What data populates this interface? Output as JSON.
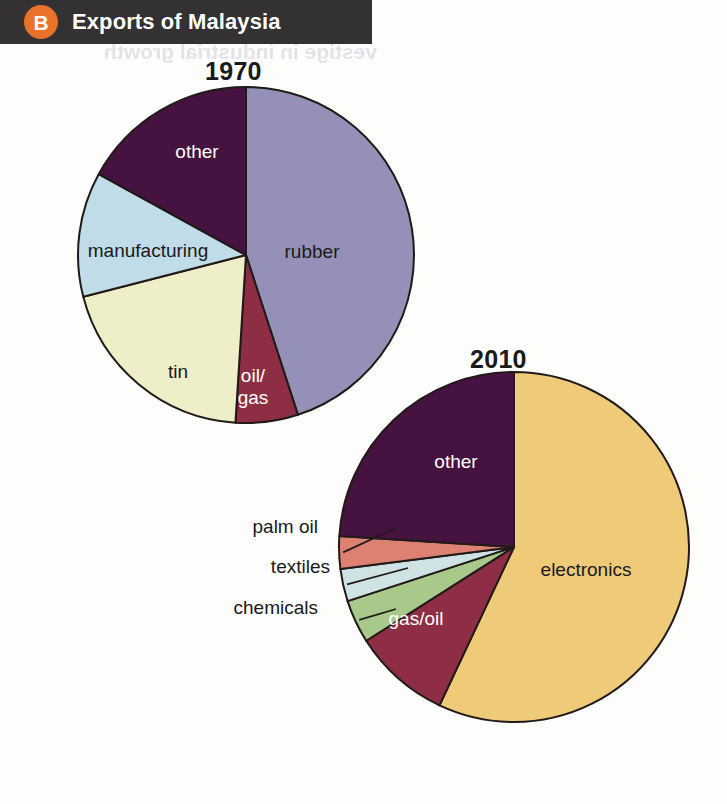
{
  "header": {
    "badge": "B",
    "title": "Exports of Malaysia",
    "badge_color": "#e8722a",
    "banner_color": "#333132",
    "text_color": "#ffffff"
  },
  "artifact": {
    "bleed_text": "vestige in industrial growth"
  },
  "chart_data": [
    {
      "type": "pie",
      "title": "1970",
      "id": "exports-1970",
      "center": {
        "x": 246,
        "y": 255
      },
      "radius": 168,
      "start_angle": 0,
      "direction": "clockwise",
      "legend": "none",
      "labels_inside": true,
      "slices": [
        {
          "label": "rubber",
          "value": 45,
          "color": "#9590b8",
          "text_color": "dark",
          "label_pos": {
            "x": 312,
            "y": 258
          }
        },
        {
          "label": "oil/\ngas",
          "value": 6,
          "color": "#8d2e44",
          "text_color": "light",
          "label_pos": {
            "x": 253,
            "y": 382
          }
        },
        {
          "label": "tin",
          "value": 20,
          "color": "#eeeec8",
          "text_color": "dark",
          "label_pos": {
            "x": 178,
            "y": 378
          }
        },
        {
          "label": "manufacturing",
          "value": 12,
          "color": "#bfdce8",
          "text_color": "dark",
          "label_pos": {
            "x": 148,
            "y": 257
          }
        },
        {
          "label": "other",
          "value": 17,
          "color": "#46123f",
          "text_color": "light",
          "label_pos": {
            "x": 197,
            "y": 158
          }
        }
      ]
    },
    {
      "type": "pie",
      "title": "2010",
      "id": "exports-2010",
      "center": {
        "x": 514,
        "y": 547
      },
      "radius": 175,
      "start_angle": 0,
      "direction": "clockwise",
      "legend": "none",
      "labels_inside": false,
      "slices": [
        {
          "label": "electronics",
          "value": 57,
          "color": "#efca79",
          "text_color": "dark",
          "label_pos": {
            "x": 586,
            "y": 576
          },
          "callout": false
        },
        {
          "label": "gas/oil",
          "value": 9,
          "color": "#8d2e44",
          "text_color": "light",
          "label_pos": {
            "x": 416,
            "y": 625
          },
          "callout": false
        },
        {
          "label": "chemicals",
          "value": 4,
          "color": "#a8c98a",
          "text_color": "dark",
          "label_pos": {
            "x": 318,
            "y": 614
          },
          "callout": true
        },
        {
          "label": "textiles",
          "value": 3,
          "color": "#cfe3e4",
          "text_color": "dark",
          "label_pos": {
            "x": 330,
            "y": 573
          },
          "callout": true
        },
        {
          "label": "palm oil",
          "value": 3,
          "color": "#dd8273",
          "text_color": "dark",
          "label_pos": {
            "x": 318,
            "y": 533
          },
          "callout": true
        },
        {
          "label": "other",
          "value": 24,
          "color": "#46123f",
          "text_color": "light",
          "label_pos": {
            "x": 456,
            "y": 468
          },
          "callout": false
        }
      ]
    }
  ],
  "colors": {
    "stroke": "#211a18",
    "background": "#fdfdfb",
    "accent_orange": "#e8722a",
    "banner_dark": "#333132"
  }
}
